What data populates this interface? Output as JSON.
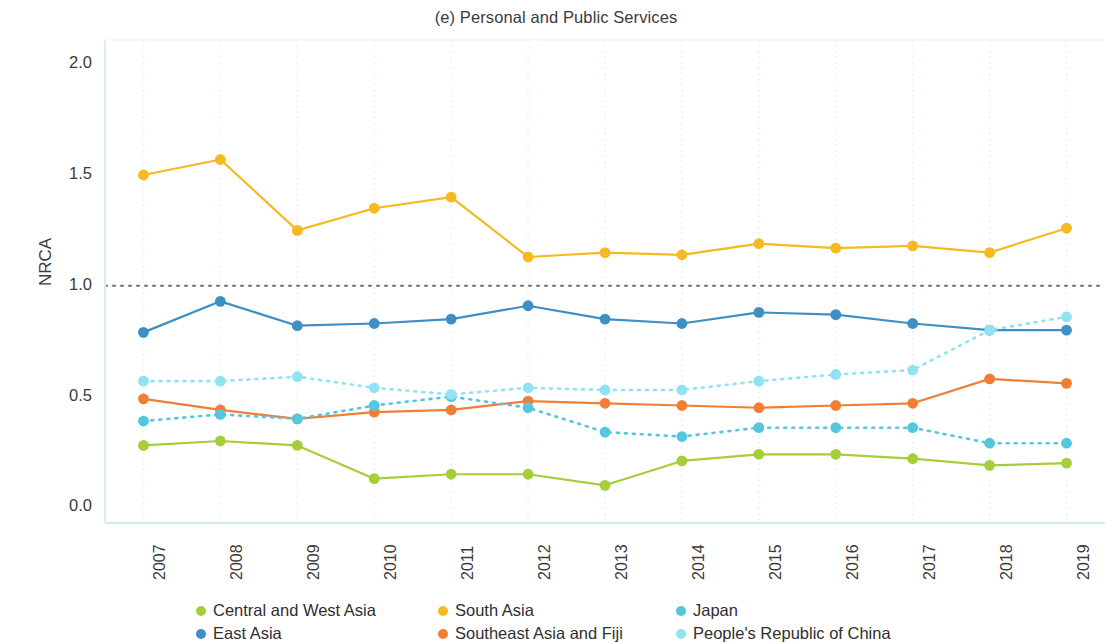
{
  "chart_data": {
    "type": "line",
    "title": "(e) Personal and Public Services",
    "xlabel": "",
    "ylabel": "NRCA",
    "x": [
      2007,
      2008,
      2009,
      2010,
      2011,
      2012,
      2013,
      2014,
      2015,
      2016,
      2017,
      2018,
      2019
    ],
    "categories": [
      "2007",
      "2008",
      "2009",
      "2010",
      "2011",
      "2012",
      "2013",
      "2014",
      "2015",
      "2016",
      "2017",
      "2018",
      "2019"
    ],
    "xlim": [
      2006.5,
      2019.5
    ],
    "ylim": [
      -0.07,
      2.1
    ],
    "yticks": [
      0.0,
      0.5,
      1.0,
      1.5,
      2.0
    ],
    "ytick_labels": [
      "0.0",
      "0.5",
      "1.0",
      "1.5",
      "2.0"
    ],
    "grid": true,
    "grid_style": "dotted-vertical",
    "legend_position": "bottom",
    "reference_line": {
      "y": 1.0,
      "style": "dotted",
      "color": "#6f6f6f"
    },
    "series": [
      {
        "name": "Central and West Asia",
        "color": "#A5CE3A",
        "style": "solid",
        "values": [
          0.28,
          0.3,
          0.28,
          0.13,
          0.15,
          0.15,
          0.1,
          0.21,
          0.24,
          0.24,
          0.22,
          0.19,
          0.2
        ]
      },
      {
        "name": "East Asia",
        "color": "#3E8FC4",
        "style": "solid",
        "values": [
          0.79,
          0.93,
          0.82,
          0.83,
          0.85,
          0.91,
          0.85,
          0.83,
          0.88,
          0.87,
          0.83,
          0.8,
          0.8
        ]
      },
      {
        "name": "South Asia",
        "color": "#F5B921",
        "style": "solid",
        "values": [
          1.5,
          1.57,
          1.25,
          1.35,
          1.4,
          1.13,
          1.15,
          1.14,
          1.19,
          1.17,
          1.18,
          1.15,
          1.26
        ]
      },
      {
        "name": "Southeast Asia and Fiji",
        "color": "#F07F35",
        "style": "solid",
        "values": [
          0.49,
          0.44,
          0.4,
          0.43,
          0.44,
          0.48,
          0.47,
          0.46,
          0.45,
          0.46,
          0.47,
          0.58,
          0.56
        ]
      },
      {
        "name": "Japan",
        "color": "#53C6E0",
        "style": "dotted",
        "values": [
          0.39,
          0.42,
          0.4,
          0.46,
          0.5,
          0.45,
          0.34,
          0.32,
          0.36,
          0.36,
          0.36,
          0.29,
          0.29
        ]
      },
      {
        "name": "People's Republic of China",
        "color": "#8FE3F2",
        "style": "dotted",
        "values": [
          0.57,
          0.57,
          0.59,
          0.54,
          0.51,
          0.54,
          0.53,
          0.53,
          0.57,
          0.6,
          0.62,
          0.8,
          0.86
        ]
      }
    ]
  },
  "axes": {
    "y_title": "NRCA",
    "y_tick_labels": [
      "0.0",
      "0.5",
      "1.0",
      "1.5",
      "2.0"
    ],
    "x_tick_labels": [
      "2007",
      "2008",
      "2009",
      "2010",
      "2011",
      "2012",
      "2013",
      "2014",
      "2015",
      "2016",
      "2017",
      "2018",
      "2019"
    ]
  },
  "legend": {
    "items": [
      {
        "label": "Central and West Asia",
        "color": "#A5CE3A"
      },
      {
        "label": "South Asia",
        "color": "#F5B921"
      },
      {
        "label": "Japan",
        "color": "#53C6E0"
      },
      {
        "label": "East Asia",
        "color": "#3E8FC4"
      },
      {
        "label": "Southeast Asia and Fiji",
        "color": "#F07F35"
      },
      {
        "label": "People's Republic of China",
        "color": "#8FE3F2"
      }
    ]
  }
}
